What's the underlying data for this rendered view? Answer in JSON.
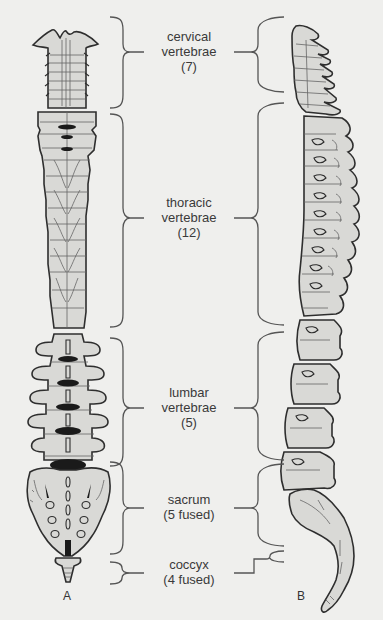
{
  "figure": {
    "panels": [
      {
        "id": "A",
        "label": "A",
        "view": "anterior"
      },
      {
        "id": "B",
        "label": "B",
        "view": "lateral"
      }
    ],
    "regions": [
      {
        "name": "cervical",
        "line1": "cervical",
        "line2": "vertebrae",
        "line3": "(7)",
        "count": 7
      },
      {
        "name": "thoracic",
        "line1": "thoracic",
        "line2": "vertebrae",
        "line3": "(12)",
        "count": 12
      },
      {
        "name": "lumbar",
        "line1": "lumbar",
        "line2": "vertebrae",
        "line3": "(5)",
        "count": 5
      },
      {
        "name": "sacrum",
        "line1": "sacrum",
        "line2": "(5 fused)",
        "count": 5
      },
      {
        "name": "coccyx",
        "line1": "coccyx",
        "line2": "(4 fused)",
        "count": 4
      }
    ]
  },
  "colors": {
    "background": "#efefed",
    "bone_fill": "#d9d9d6",
    "bone_stroke": "#2e2e2e",
    "bracket": "#555555",
    "text": "#3a3a3a",
    "dark_shadow": "#1a1a1a"
  }
}
